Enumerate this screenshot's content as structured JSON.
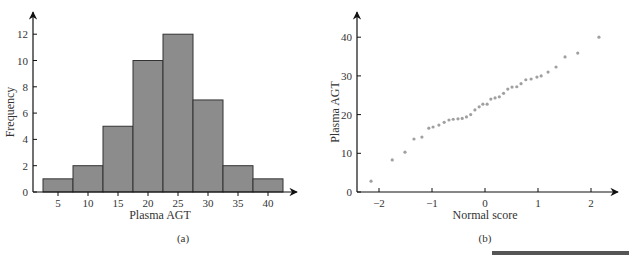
{
  "chart_data": [
    {
      "type": "bar",
      "subtype": "histogram",
      "panel_label": "(a)",
      "title": "",
      "xlabel": "Plasma AGT",
      "ylabel": "Frequency",
      "categories": [
        "5",
        "10",
        "15",
        "20",
        "25",
        "30",
        "35",
        "40"
      ],
      "bin_edges": [
        2.5,
        7.5,
        12.5,
        17.5,
        22.5,
        27.5,
        32.5,
        37.5,
        42.5
      ],
      "values": [
        1,
        2,
        5,
        10,
        12,
        7,
        2,
        1
      ],
      "xticks": [
        5,
        10,
        15,
        20,
        25,
        30,
        35,
        40
      ],
      "yticks": [
        0,
        2,
        4,
        6,
        8,
        10,
        12
      ],
      "ylim": [
        0,
        13.5
      ],
      "grid": false,
      "bar_color": "#8c8c8c",
      "edge_color": "#333333"
    },
    {
      "type": "scatter",
      "panel_label": "(b)",
      "title": "",
      "xlabel": "Normal score",
      "ylabel": "Plasma AGT",
      "xticks": [
        -2,
        -1,
        0,
        1,
        2
      ],
      "yticks": [
        0,
        10,
        20,
        30,
        40
      ],
      "xlim": [
        -2.4,
        2.5
      ],
      "ylim": [
        0,
        45
      ],
      "grid": false,
      "point_color": "#a0a0a0",
      "x": [
        -2.15,
        -1.75,
        -1.51,
        -1.34,
        -1.19,
        -1.06,
        -0.98,
        -0.87,
        -0.77,
        -0.68,
        -0.6,
        -0.51,
        -0.43,
        -0.35,
        -0.27,
        -0.19,
        -0.11,
        -0.04,
        0.04,
        0.11,
        0.19,
        0.27,
        0.35,
        0.43,
        0.51,
        0.6,
        0.68,
        0.77,
        0.87,
        0.98,
        1.06,
        1.19,
        1.34,
        1.51,
        1.75,
        2.15
      ],
      "y": [
        2.8,
        8.3,
        10.3,
        13.7,
        14.2,
        16.5,
        16.8,
        17.3,
        18.0,
        18.6,
        18.8,
        18.9,
        19.0,
        19.4,
        20.0,
        21.2,
        22.0,
        22.7,
        22.7,
        24.0,
        24.3,
        24.6,
        25.5,
        26.6,
        27.1,
        27.2,
        28.0,
        29.0,
        29.2,
        29.7,
        30.0,
        31.0,
        32.3,
        34.9,
        35.9,
        40.0
      ]
    }
  ],
  "decoration": {
    "bottom_rule_color": "#555555"
  }
}
